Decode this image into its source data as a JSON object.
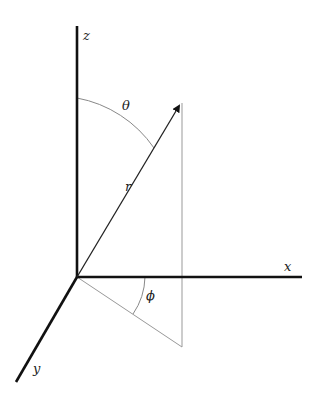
{
  "diagram": {
    "type": "spherical-coordinates",
    "origin": [
      77,
      277
    ],
    "axes": {
      "z": {
        "label": "z",
        "from": [
          77,
          277
        ],
        "to": [
          77,
          26
        ],
        "label_pos": [
          83,
          40
        ]
      },
      "x": {
        "label": "x",
        "from": [
          77,
          277
        ],
        "to": [
          302,
          277
        ],
        "label_pos": [
          285,
          271
        ]
      },
      "y": {
        "label": "y",
        "from": [
          77,
          277
        ],
        "to": [
          16,
          382
        ],
        "label_pos": [
          33,
          373
        ]
      }
    },
    "vector": {
      "label": "r",
      "from": [
        77,
        277
      ],
      "to": [
        181,
        103
      ],
      "label_pos": [
        125,
        191
      ]
    },
    "projection": {
      "drop_from": [
        182,
        103
      ],
      "foot": [
        182,
        347
      ]
    },
    "angles": {
      "theta": {
        "label": "θ",
        "label_pos": [
          123,
          109
        ]
      },
      "phi": {
        "label": "ϕ",
        "label_pos": [
          146,
          300
        ]
      }
    },
    "colors": {
      "axis": "#111111",
      "vector": "#222222",
      "guide": "#999999",
      "arc": "#888888"
    }
  }
}
